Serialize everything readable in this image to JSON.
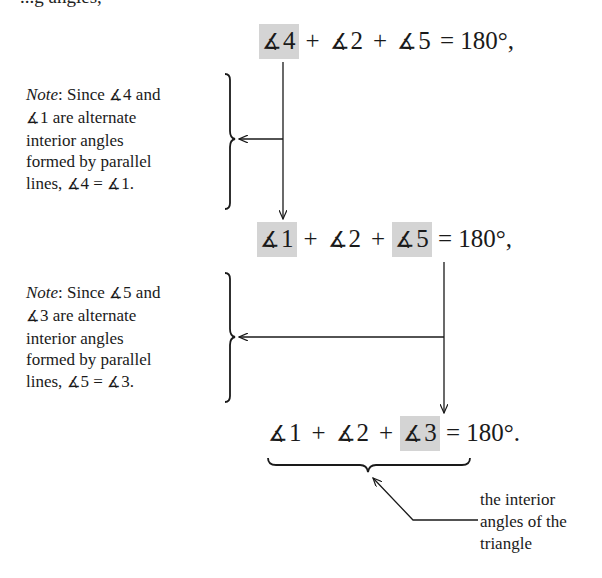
{
  "clipped_top_text": "...g angles,",
  "angle_symbol": "∡",
  "equations": [
    {
      "terms": [
        {
          "text": "4",
          "highlighted": true
        },
        {
          "text": "2",
          "highlighted": false
        },
        {
          "text": "5",
          "highlighted": false
        }
      ],
      "plus": "+",
      "rhs": "= 180°,"
    },
    {
      "terms": [
        {
          "text": "1",
          "highlighted": true
        },
        {
          "text": "2",
          "highlighted": false
        },
        {
          "text": "5",
          "highlighted": true
        }
      ],
      "plus": "+",
      "rhs": "= 180°,"
    },
    {
      "terms": [
        {
          "text": "1",
          "highlighted": false
        },
        {
          "text": "2",
          "highlighted": false
        },
        {
          "text": "3",
          "highlighted": true
        }
      ],
      "plus": "+",
      "rhs": "= 180°."
    }
  ],
  "notes": [
    {
      "label": "Note",
      "lines": [
        {
          "pre": ":   Since ",
          "ang": "4",
          "post": " and"
        },
        {
          "pre": "",
          "ang": "1",
          "post": " are alternate"
        },
        {
          "pre": "interior angles",
          "ang": null,
          "post": ""
        },
        {
          "pre": "formed by parallel",
          "ang": null,
          "post": ""
        },
        {
          "pre": "lines, ",
          "ang": "4",
          "mid": " = ",
          "ang2": "1",
          "post": "."
        }
      ]
    },
    {
      "label": "Note",
      "lines": [
        {
          "pre": ":   Since ",
          "ang": "5",
          "post": " and"
        },
        {
          "pre": "",
          "ang": "3",
          "post": " are alternate"
        },
        {
          "pre": "interior angles",
          "ang": null,
          "post": ""
        },
        {
          "pre": "formed by parallel",
          "ang": null,
          "post": ""
        },
        {
          "pre": "lines, ",
          "ang": "5",
          "mid": " = ",
          "ang2": "3",
          "post": "."
        }
      ]
    }
  ],
  "underbrace_label": {
    "lines": [
      "the interior",
      "angles of the",
      "triangle"
    ]
  },
  "colors": {
    "highlight": "#d4d4d4",
    "ink": "#1a1a1a"
  }
}
